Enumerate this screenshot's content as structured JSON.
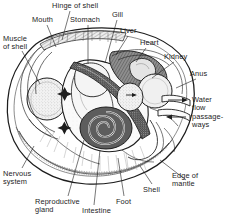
{
  "figure": {
    "background_color": "#ffffff",
    "ink_color": "#1d1d1d",
    "labels": [
      {
        "id": "hinge-of-shell",
        "text": "Hinge of shell",
        "x": 52,
        "y": 2,
        "align": "left"
      },
      {
        "id": "mouth",
        "text": "Mouth",
        "x": 32,
        "y": 16,
        "align": "left"
      },
      {
        "id": "stomach",
        "text": "Stomach",
        "x": 70,
        "y": 16,
        "align": "left"
      },
      {
        "id": "gill",
        "text": "Gill",
        "x": 112,
        "y": 11,
        "align": "left"
      },
      {
        "id": "liver",
        "text": "Liver",
        "x": 120,
        "y": 27,
        "align": "left"
      },
      {
        "id": "heart",
        "text": "Heart",
        "x": 140,
        "y": 39,
        "align": "left"
      },
      {
        "id": "kidney",
        "text": "Kidney",
        "x": 164,
        "y": 53,
        "align": "left"
      },
      {
        "id": "anus",
        "text": "Anus",
        "x": 190,
        "y": 70,
        "align": "left"
      },
      {
        "id": "muscle-of-shell",
        "text": "Muscle\nof shell",
        "x": 3,
        "y": 35,
        "align": "left"
      },
      {
        "id": "water-flow-passageways",
        "text": "Water\nflow\npassage-\nways",
        "x": 192,
        "y": 96,
        "align": "left"
      },
      {
        "id": "edge-of-mantle",
        "text": "Edge of\nmantle",
        "x": 172,
        "y": 172,
        "align": "left"
      },
      {
        "id": "shell",
        "text": "Shell",
        "x": 143,
        "y": 186,
        "align": "left"
      },
      {
        "id": "foot",
        "text": "Foot",
        "x": 116,
        "y": 198,
        "align": "left"
      },
      {
        "id": "intestine",
        "text": "Intestine",
        "x": 82,
        "y": 207,
        "align": "left"
      },
      {
        "id": "reproductive-gland",
        "text": "Reproductive\ngland",
        "x": 35,
        "y": 198,
        "align": "left"
      },
      {
        "id": "nervous-system",
        "text": "Nervous\nsystem",
        "x": 3,
        "y": 170,
        "align": "left"
      }
    ]
  }
}
